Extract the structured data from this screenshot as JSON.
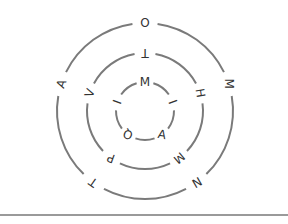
{
  "puzzle": {
    "type": "concentric-letter-rings",
    "rings": [
      {
        "name": "outer",
        "letters": [
          "O",
          "M",
          "N",
          "T",
          "A"
        ]
      },
      {
        "name": "middle",
        "letters": [
          "T",
          "H",
          "M",
          "P",
          "V"
        ]
      },
      {
        "name": "inner",
        "letters": [
          "M",
          "I",
          "A",
          "Q",
          "I"
        ]
      }
    ]
  },
  "colors": {
    "ring_stroke": "#7a7a7a",
    "letter": "#333333",
    "divider": "#9a9a9a"
  }
}
